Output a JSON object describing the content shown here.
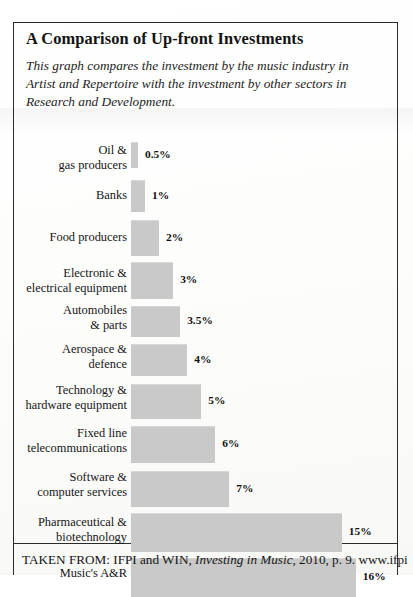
{
  "document": {
    "title": "A Comparison of Up-front Investments",
    "intro": "This graph compares the investment by the music industry in Artist and Repertoire with the investment by other sectors in Research and Development.",
    "source_prefix": "TAKEN FROM: IFPI and WIN, ",
    "source_italic": "Investing in Music",
    "source_suffix": ", 2010, p. 9. www.ifpi"
  },
  "chart_data": {
    "type": "bar",
    "orientation": "horizontal",
    "title": "A Comparison of Up-front Investments",
    "subtitle": "This graph compares the investment by the music industry in Artist and Repertoire with the investment by other sectors in Research and Development.",
    "xlabel": "",
    "ylabel": "",
    "xlim": [
      0,
      16
    ],
    "grid": false,
    "legend": false,
    "bar_color": "#c9c9c9",
    "unit": "%",
    "categories": [
      "Oil &\ngas producers",
      "Banks",
      "Food producers",
      "Electronic &\nelectrical equipment",
      "Automobiles\n& parts",
      "Aerospace &\ndefence",
      "Technology &\nhardware equipment",
      "Fixed line\ntelecommunications",
      "Software &\ncomputer services",
      "Pharmaceutical &\nbiotechnology",
      "Music's A&R"
    ],
    "values": [
      0.5,
      1,
      2,
      3,
      3.5,
      4,
      5,
      6,
      7,
      15,
      16
    ],
    "value_labels": [
      "0.5%",
      "1%",
      "2%",
      "3%",
      "3.5%",
      "4%",
      "5%",
      "6%",
      "7%",
      "15%",
      "16%"
    ]
  },
  "layout": {
    "rows": [
      {
        "top": 4,
        "bar_h": 25,
        "label_top": 5
      },
      {
        "top": 42,
        "bar_h": 31,
        "label_top": 50
      },
      {
        "top": 82,
        "bar_h": 35,
        "label_top": 92
      },
      {
        "top": 124,
        "bar_h": 36,
        "label_top": 128
      },
      {
        "top": 168,
        "bar_h": 30,
        "label_top": 165
      },
      {
        "top": 206,
        "bar_h": 31,
        "label_top": 204
      },
      {
        "top": 246,
        "bar_h": 34,
        "label_top": 245
      },
      {
        "top": 288,
        "bar_h": 36,
        "label_top": 288
      },
      {
        "top": 333,
        "bar_h": 35,
        "label_top": 332
      },
      {
        "top": 375,
        "bar_h": 38,
        "label_top": 377
      },
      {
        "top": 420,
        "bar_h": 38,
        "label_top": 428
      }
    ],
    "px_per_unit": 14.05,
    "value_gap": 7
  }
}
